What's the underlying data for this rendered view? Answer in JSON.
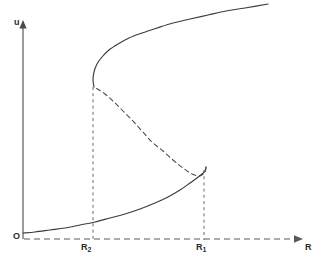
{
  "figure": {
    "type": "bifurcation-diagram",
    "background_color": "#ffffff",
    "curve_color": "#3c3c3c",
    "axis_color": "#4a4a4a",
    "dash_color": "#5a5a5a",
    "width": 322,
    "height": 260
  },
  "axes": {
    "y_axis": {
      "label": "u",
      "style": "solid",
      "arrow": true,
      "x": 23,
      "y_top": 22,
      "y_bottom": 239
    },
    "x_axis": {
      "label": "R",
      "style": "dashed",
      "arrow": true,
      "y": 239,
      "x_left": 24,
      "x_right": 302
    },
    "origin_label": "O"
  },
  "ticks": [
    {
      "name": "R-two-tick",
      "label": "R",
      "subscript": "2",
      "x": 93
    },
    {
      "name": "R-one-tick",
      "label": "R",
      "subscript": "1",
      "x": 204
    }
  ],
  "chart_data": {
    "type": "line",
    "title": "",
    "xlabel": "R",
    "ylabel": "u",
    "grid": false,
    "legend": null,
    "annotations": [
      "O",
      "R₂",
      "R₁"
    ],
    "xlim": [
      0,
      302
    ],
    "ylim": [
      0,
      260
    ],
    "series": [
      {
        "name": "lower-stable-branch",
        "style": "solid",
        "points": [
          [
            23,
            233
          ],
          [
            35,
            232
          ],
          [
            50,
            230
          ],
          [
            65,
            228
          ],
          [
            80,
            225
          ],
          [
            95,
            222
          ],
          [
            110,
            218
          ],
          [
            125,
            214
          ],
          [
            140,
            209
          ],
          [
            155,
            203
          ],
          [
            168,
            197
          ],
          [
            180,
            190
          ],
          [
            190,
            183
          ],
          [
            197,
            178
          ],
          [
            202,
            174
          ],
          [
            205,
            171
          ],
          [
            206,
            167
          ]
        ]
      },
      {
        "name": "middle-unstable-branch",
        "style": "dashed",
        "points": [
          [
            206,
            167
          ],
          [
            205,
            172
          ],
          [
            200,
            176
          ],
          [
            192,
            174
          ],
          [
            183,
            168
          ],
          [
            173,
            160
          ],
          [
            163,
            151
          ],
          [
            152,
            142
          ],
          [
            142,
            131
          ],
          [
            132,
            120
          ],
          [
            122,
            110
          ],
          [
            113,
            101
          ],
          [
            105,
            94
          ],
          [
            99,
            90
          ],
          [
            94,
            87
          ]
        ]
      },
      {
        "name": "upper-stable-branch",
        "style": "solid",
        "points": [
          [
            94,
            87
          ],
          [
            93,
            80
          ],
          [
            94,
            72
          ],
          [
            97,
            64
          ],
          [
            102,
            57
          ],
          [
            109,
            50
          ],
          [
            118,
            44
          ],
          [
            129,
            38
          ],
          [
            142,
            33
          ],
          [
            157,
            28
          ],
          [
            173,
            23
          ],
          [
            190,
            19
          ],
          [
            208,
            15
          ],
          [
            226,
            11
          ],
          [
            245,
            8
          ],
          [
            268,
            4
          ]
        ]
      }
    ],
    "drop_lines": [
      {
        "name": "R-two-drop-line",
        "x": 93,
        "y_top": 87,
        "y_bottom": 240,
        "style": "dashed"
      },
      {
        "name": "R-one-drop-line",
        "x": 204,
        "y_top": 170,
        "y_bottom": 240,
        "style": "dashed"
      }
    ]
  }
}
